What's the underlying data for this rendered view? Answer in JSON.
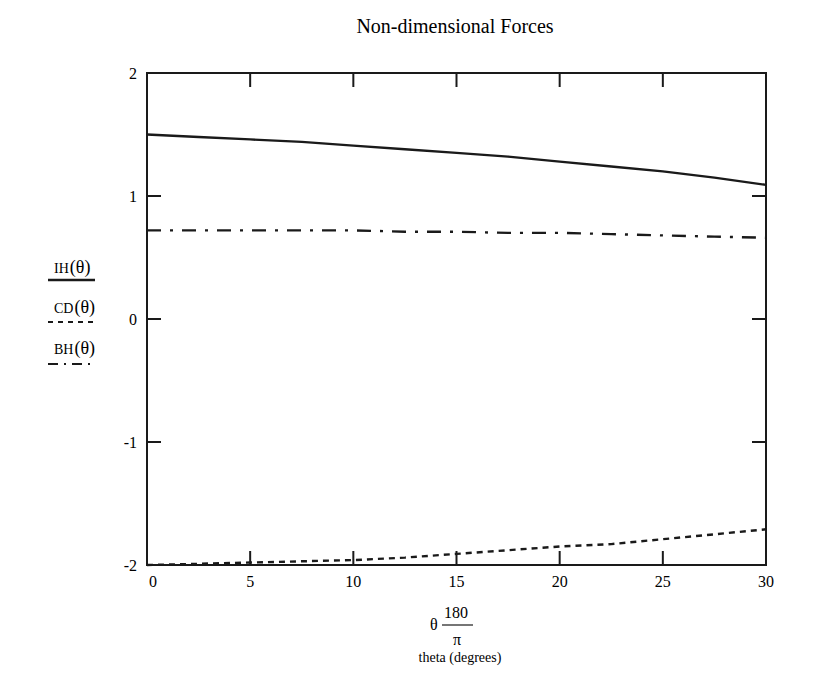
{
  "chart_data": {
    "type": "line",
    "title": "Non-dimensional Forces",
    "xlabel": {
      "expression": "θ · 180/π",
      "var": "θ",
      "numerator": "180",
      "denominator": "π",
      "caption": "theta (degrees)"
    },
    "ylabel": [
      "IH(θ)",
      "CD(θ)",
      "BH(θ)"
    ],
    "xlim": [
      0,
      30
    ],
    "ylim": [
      -2,
      2
    ],
    "xticks": [
      0,
      5,
      10,
      15,
      20,
      25,
      30
    ],
    "yticks": [
      -2,
      -1,
      0,
      1,
      2
    ],
    "xtick_labels": [
      "0",
      "5",
      "10",
      "15",
      "20",
      "25",
      "30"
    ],
    "ytick_labels": [
      "-2",
      "-1",
      "0",
      "1",
      "2"
    ],
    "grid": false,
    "legend_position": "left (stacked under y-axis label)",
    "x": [
      0,
      2.5,
      5,
      7.5,
      10,
      12.5,
      15,
      17.5,
      20,
      22.5,
      25,
      27.5,
      30
    ],
    "series": [
      {
        "name": "IH(θ)",
        "line_style": "solid",
        "values": [
          1.5,
          1.48,
          1.46,
          1.44,
          1.41,
          1.38,
          1.35,
          1.32,
          1.28,
          1.24,
          1.2,
          1.15,
          1.09
        ]
      },
      {
        "name": "CD(θ)",
        "line_style": "dashed",
        "values": [
          -2.0,
          -1.99,
          -1.98,
          -1.97,
          -1.96,
          -1.94,
          -1.91,
          -1.88,
          -1.85,
          -1.83,
          -1.79,
          -1.75,
          -1.71
        ]
      },
      {
        "name": "BH(θ)",
        "line_style": "dash-dot",
        "values": [
          0.72,
          0.72,
          0.72,
          0.72,
          0.72,
          0.71,
          0.71,
          0.7,
          0.7,
          0.69,
          0.68,
          0.67,
          0.66
        ]
      }
    ]
  },
  "legend": {
    "items": [
      {
        "prefix": "IH",
        "arg": "θ",
        "style": "solid"
      },
      {
        "prefix": "CD",
        "arg": "θ",
        "style": "dashed"
      },
      {
        "prefix": "BH",
        "arg": "θ",
        "style": "dash-dot"
      }
    ]
  },
  "colors": {
    "line": "#1a1a1a",
    "frame": "#1a1a1a",
    "background": "#ffffff"
  }
}
